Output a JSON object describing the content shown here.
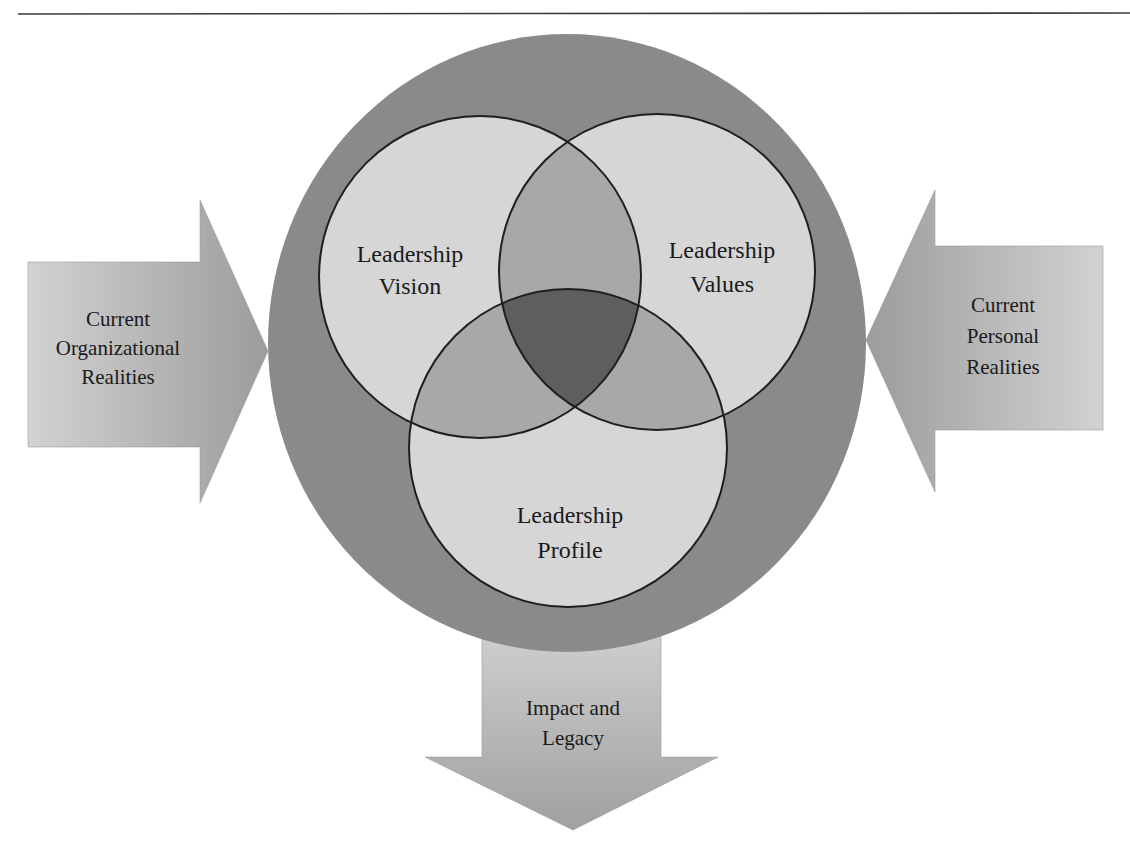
{
  "diagram": {
    "outer_circle": {
      "fill": "#8a8a8a"
    },
    "venn": {
      "circle_fill": "#d6d6d6",
      "pair_overlap_fill": "#a8a8a8",
      "center_overlap_fill": "#5e5e5e",
      "stroke": "#1f1f1f",
      "circles": [
        {
          "id": "vision",
          "line1": "Leadership",
          "line2": "Vision"
        },
        {
          "id": "values",
          "line1": "Leadership",
          "line2": "Values"
        },
        {
          "id": "profile",
          "line1": "Leadership",
          "line2": "Profile"
        }
      ]
    },
    "arrows": {
      "left": {
        "line1": "Current",
        "line2": "Organizational",
        "line3": "Realities"
      },
      "right": {
        "line1": "Current",
        "line2": "Personal",
        "line3": "Realities"
      },
      "bottom": {
        "line1": "Impact and",
        "line2": "Legacy"
      }
    }
  }
}
